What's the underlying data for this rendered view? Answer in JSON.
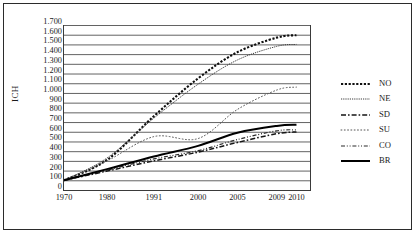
{
  "axis": {
    "ylabel": "ICH",
    "yticks": [
      "1.700",
      "1.600",
      "1.500",
      "1.400",
      "1.300",
      "1.200",
      "1.100",
      "1.000",
      "900",
      "800",
      "700",
      "600",
      "500",
      "400",
      "300",
      "200",
      "100",
      "0"
    ],
    "xticks": [
      "1970",
      "1980",
      "1991",
      "2000",
      "2005",
      "2009",
      "2010"
    ]
  },
  "legend": {
    "items": [
      {
        "label": "NO",
        "style": "dotted-bold"
      },
      {
        "label": "NE",
        "style": "fine-dotted"
      },
      {
        "label": "SD",
        "style": "dash-dot"
      },
      {
        "label": "SU",
        "style": "sparse-dotted"
      },
      {
        "label": "CO",
        "style": "dash-dot-dot"
      },
      {
        "label": "BR",
        "style": "solid-bold"
      }
    ]
  },
  "chart_data": {
    "type": "line",
    "title": "",
    "xlabel": "",
    "ylabel": "ICH",
    "ylim": [
      0,
      1700
    ],
    "ytick_step": 100,
    "grid": true,
    "legend_position": "right",
    "x": [
      1970,
      1980,
      1991,
      2000,
      2005,
      2009,
      2010
    ],
    "series": [
      {
        "name": "NO",
        "style": "dotted-bold",
        "values": [
          100,
          310,
          760,
          1150,
          1420,
          1570,
          1595
        ]
      },
      {
        "name": "NE",
        "style": "fine-dotted",
        "values": [
          100,
          330,
          740,
          1090,
          1340,
          1480,
          1500
        ]
      },
      {
        "name": "SD",
        "style": "dash-dot",
        "values": [
          100,
          195,
          300,
          390,
          490,
          580,
          598
        ]
      },
      {
        "name": "SU",
        "style": "sparse-dotted",
        "values": [
          100,
          300,
          550,
          530,
          830,
          1030,
          1060
        ]
      },
      {
        "name": "CO",
        "style": "dash-dot-dot",
        "values": [
          100,
          205,
          320,
          405,
          520,
          610,
          620
        ]
      },
      {
        "name": "BR",
        "style": "solid-bold",
        "values": [
          100,
          215,
          345,
          455,
          590,
          660,
          672
        ]
      }
    ]
  }
}
